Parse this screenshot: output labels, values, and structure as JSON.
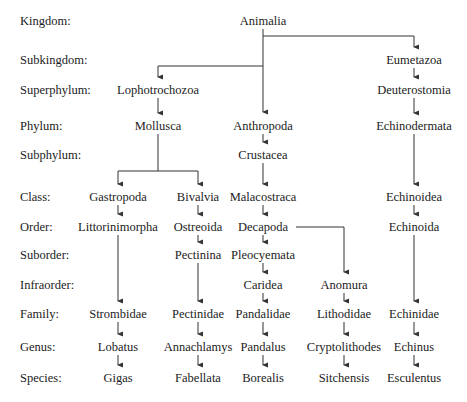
{
  "ranks": [
    {
      "label": "Kingdom:",
      "y": 14
    },
    {
      "label": "Subkingdom:",
      "y": 53
    },
    {
      "label": "Superphylum:",
      "y": 83
    },
    {
      "label": "Phylum:",
      "y": 119
    },
    {
      "label": "Subphylum:",
      "y": 148
    },
    {
      "label": "Class:",
      "y": 190
    },
    {
      "label": "Order:",
      "y": 220
    },
    {
      "label": "Suborder:",
      "y": 248
    },
    {
      "label": "Infraorder:",
      "y": 278
    },
    {
      "label": "Family:",
      "y": 307
    },
    {
      "label": "Genus:",
      "y": 340
    },
    {
      "label": "Species:",
      "y": 371
    }
  ],
  "nodes": {
    "animalia": {
      "label": "Animalia",
      "x": 263,
      "y": 14
    },
    "eumetazoa": {
      "label": "Eumetazoa",
      "x": 414,
      "y": 53
    },
    "lophotrochozoa": {
      "label": "Lophotrochozoa",
      "x": 158,
      "y": 83
    },
    "deuterostomia": {
      "label": "Deuterostomia",
      "x": 414,
      "y": 83
    },
    "mollusca": {
      "label": "Mollusca",
      "x": 158,
      "y": 119
    },
    "anthropoda": {
      "label": "Anthropoda",
      "x": 263,
      "y": 119
    },
    "echinodermata": {
      "label": "Echinodermata",
      "x": 414,
      "y": 119
    },
    "crustacea": {
      "label": "Crustacea",
      "x": 263,
      "y": 148
    },
    "gastropoda": {
      "label": "Gastropoda",
      "x": 118,
      "y": 190
    },
    "bivalvia": {
      "label": "Bivalvia",
      "x": 198,
      "y": 190
    },
    "malacostraca": {
      "label": "Malacostraca",
      "x": 263,
      "y": 190
    },
    "echinoidea": {
      "label": "Echinoidea",
      "x": 414,
      "y": 190
    },
    "littorinimorpha": {
      "label": "Littorinimorpha",
      "x": 118,
      "y": 220
    },
    "ostreoida": {
      "label": "Ostreoida",
      "x": 198,
      "y": 220
    },
    "decapoda": {
      "label": "Decapoda",
      "x": 263,
      "y": 220
    },
    "echinoida": {
      "label": "Echinoida",
      "x": 414,
      "y": 220
    },
    "pectinina": {
      "label": "Pectinina",
      "x": 198,
      "y": 248
    },
    "pleocyemata": {
      "label": "Pleocyemata",
      "x": 263,
      "y": 248
    },
    "caridea": {
      "label": "Caridea",
      "x": 263,
      "y": 278
    },
    "anomura": {
      "label": "Anomura",
      "x": 344,
      "y": 278
    },
    "strombidae": {
      "label": "Strombidae",
      "x": 118,
      "y": 307
    },
    "pectinidae": {
      "label": "Pectinidae",
      "x": 198,
      "y": 307
    },
    "pandalidae": {
      "label": "Pandalidae",
      "x": 263,
      "y": 307
    },
    "lithodidae": {
      "label": "Lithodidae",
      "x": 344,
      "y": 307
    },
    "echinidae": {
      "label": "Echinidae",
      "x": 414,
      "y": 307
    },
    "lobatus": {
      "label": "Lobatus",
      "x": 118,
      "y": 340
    },
    "annachlamys": {
      "label": "Annachlamys",
      "x": 198,
      "y": 340
    },
    "pandalus": {
      "label": "Pandalus",
      "x": 263,
      "y": 340
    },
    "cryptolithodes": {
      "label": "Cryptolithodes",
      "x": 344,
      "y": 340
    },
    "echinus": {
      "label": "Echinus",
      "x": 414,
      "y": 340
    },
    "gigas": {
      "label": "Gigas",
      "x": 118,
      "y": 371
    },
    "fabellata": {
      "label": "Fabellata",
      "x": 198,
      "y": 371
    },
    "borealis": {
      "label": "Borealis",
      "x": 263,
      "y": 371
    },
    "sitchensis": {
      "label": "Sitchensis",
      "x": 344,
      "y": 371
    },
    "esculentus": {
      "label": "Esculentus",
      "x": 414,
      "y": 371
    }
  },
  "edges": [
    [
      "animalia",
      "anthropoda"
    ],
    [
      "animalia",
      "lophotrochozoa"
    ],
    [
      "animalia",
      "eumetazoa"
    ],
    [
      "eumetazoa",
      "deuterostomia"
    ],
    [
      "deuterostomia",
      "echinodermata"
    ],
    [
      "echinodermata",
      "echinoidea"
    ],
    [
      "echinoidea",
      "echinoida"
    ],
    [
      "echinoida",
      "echinidae"
    ],
    [
      "echinidae",
      "echinus"
    ],
    [
      "echinus",
      "esculentus"
    ],
    [
      "lophotrochozoa",
      "mollusca"
    ],
    [
      "mollusca",
      "gastropoda"
    ],
    [
      "mollusca",
      "bivalvia"
    ],
    [
      "gastropoda",
      "littorinimorpha"
    ],
    [
      "littorinimorpha",
      "strombidae"
    ],
    [
      "strombidae",
      "lobatus"
    ],
    [
      "lobatus",
      "gigas"
    ],
    [
      "bivalvia",
      "ostreoida"
    ],
    [
      "ostreoida",
      "pectinina"
    ],
    [
      "pectinina",
      "pectinidae"
    ],
    [
      "pectinidae",
      "annachlamys"
    ],
    [
      "annachlamys",
      "fabellata"
    ],
    [
      "anthropoda",
      "crustacea"
    ],
    [
      "crustacea",
      "malacostraca"
    ],
    [
      "malacostraca",
      "decapoda"
    ],
    [
      "decapoda",
      "pleocyemata"
    ],
    [
      "pleocyemata",
      "caridea"
    ],
    [
      "caridea",
      "pandalidae"
    ],
    [
      "pandalidae",
      "pandalus"
    ],
    [
      "pandalus",
      "borealis"
    ],
    [
      "decapoda",
      "anomura"
    ],
    [
      "anomura",
      "lithodidae"
    ],
    [
      "lithodidae",
      "cryptolithodes"
    ],
    [
      "cryptolithodes",
      "sitchensis"
    ]
  ],
  "style": {
    "line_color": "#333333",
    "text_color": "#222222",
    "background": "#ffffff"
  }
}
